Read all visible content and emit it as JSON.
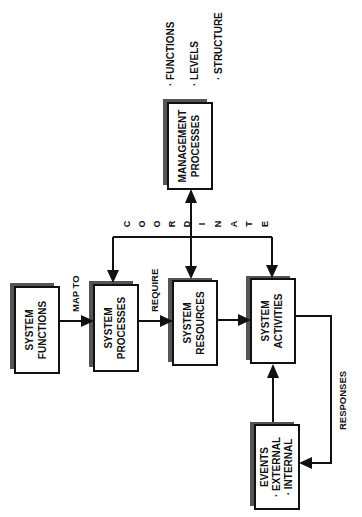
{
  "diagram": {
    "orientation": "rotated-90-ccw",
    "nodes": [
      {
        "id": "system_functions",
        "lines": [
          "SYSTEM",
          "FUNCTIONS"
        ]
      },
      {
        "id": "system_processes",
        "lines": [
          "SYSTEM",
          "PROCESSES"
        ]
      },
      {
        "id": "system_resources",
        "lines": [
          "SYSTEM",
          "RESOURCES"
        ]
      },
      {
        "id": "system_activities",
        "lines": [
          "SYSTEM",
          "ACTIVITIES"
        ]
      },
      {
        "id": "management_processes",
        "lines": [
          "MANAGEMENT",
          "PROCESSES"
        ]
      },
      {
        "id": "events",
        "lines": [
          "EVENTS",
          "· EXTERNAL",
          "· INTERNAL"
        ]
      }
    ],
    "management_attributes": [
      "· FUNCTIONS",
      "· LEVELS",
      "· STRUCTURE"
    ],
    "edges": [
      {
        "from": "system_functions",
        "to": "system_processes",
        "label": "MAP TO"
      },
      {
        "from": "system_processes",
        "to": "system_resources",
        "label": "REQUIRE"
      },
      {
        "from": "system_resources",
        "to": "system_activities",
        "label": ""
      },
      {
        "from": "management_processes",
        "to": [
          "system_processes",
          "system_resources",
          "system_activities"
        ],
        "label": "C O O R D I N A T E"
      },
      {
        "from": "system_activities",
        "to": "events",
        "label": "RESPONSES"
      },
      {
        "from": "events",
        "to": "system_activities",
        "label": ""
      }
    ],
    "coordinate_letters": [
      "C",
      "O",
      "O",
      "R",
      "D",
      "I",
      "N",
      "A",
      "T",
      "E"
    ]
  }
}
